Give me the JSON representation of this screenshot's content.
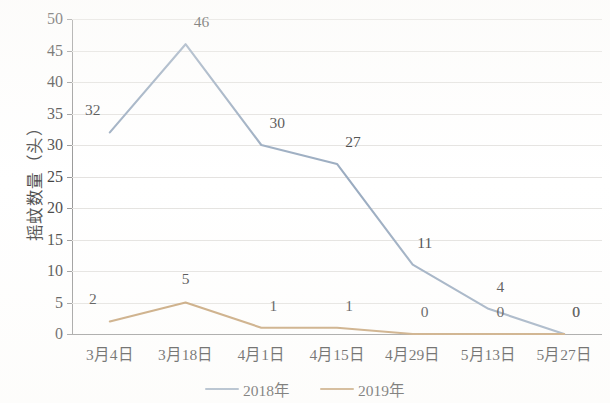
{
  "chart_data": {
    "type": "line",
    "title": "",
    "xlabel": "",
    "ylabel": "摇蚊数量（头）",
    "categories": [
      "3月4日",
      "3月18日",
      "4月1日",
      "4月15日",
      "4月29日",
      "5月13日",
      "5月27日"
    ],
    "series": [
      {
        "name": "2018年",
        "color": "#8096b0",
        "values": [
          32,
          46,
          30,
          27,
          11,
          4,
          0
        ],
        "labels": [
          "32",
          "46",
          "30",
          "27",
          "11",
          "4",
          "0"
        ]
      },
      {
        "name": "2019年",
        "color": "#b5884f",
        "values": [
          2,
          5,
          1,
          1,
          0,
          0,
          0
        ],
        "labels": [
          "2",
          "5",
          "1",
          "1",
          "0",
          "0",
          "0"
        ]
      }
    ],
    "ylim": [
      0,
      50
    ],
    "ytick_step": 5,
    "yticks": [
      "0",
      "5",
      "10",
      "15",
      "20",
      "25",
      "30",
      "35",
      "40",
      "45",
      "50"
    ],
    "grid": true,
    "legend_position": "bottom"
  },
  "axis": {
    "y_title": "摇蚊数量（头）"
  },
  "legend": {
    "items": [
      {
        "label": "2018年",
        "color": "#8096b0"
      },
      {
        "label": "2019年",
        "color": "#b5884f"
      }
    ]
  },
  "colors": {
    "series_2018": "#8096b0",
    "series_2019": "#b5884f",
    "gridline": "#dddbd8",
    "axis": "#7d7d7d",
    "text": "#111111",
    "background": "#ffffff"
  }
}
